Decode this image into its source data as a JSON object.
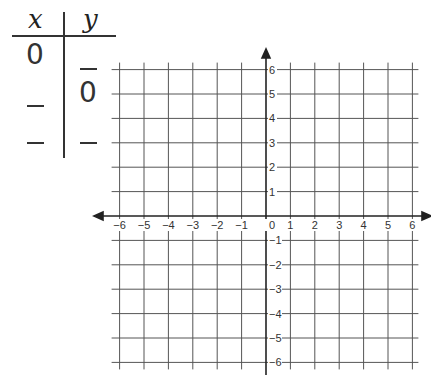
{
  "table": {
    "headers": [
      "x",
      "y"
    ],
    "rows": [
      {
        "x": "0",
        "y": "_"
      },
      {
        "x": "_",
        "y": "0"
      },
      {
        "x": "_",
        "y": "_"
      }
    ]
  },
  "grid": {
    "x_range": [
      -6,
      6
    ],
    "y_range": [
      -6,
      6
    ],
    "x_ticks": [
      "-6",
      "-5",
      "-4",
      "-3",
      "-2",
      "-1",
      "0",
      "1",
      "2",
      "3",
      "4",
      "5",
      "6"
    ],
    "y_ticks": [
      "6",
      "5",
      "4",
      "3",
      "2",
      "1",
      "-1",
      "-2",
      "-3",
      "-4",
      "-5",
      "-6"
    ],
    "origin_label": "0",
    "line_color": "#555555"
  },
  "chart_data": {
    "type": "scatter",
    "title": "",
    "xlabel": "",
    "ylabel": "",
    "xlim": [
      -6,
      6
    ],
    "ylim": [
      -6,
      6
    ],
    "grid": true,
    "x": [],
    "y": []
  }
}
